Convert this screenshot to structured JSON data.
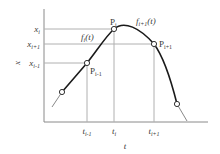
{
  "diagram": {
    "type": "piecewise-curve-interpolation",
    "colors": {
      "axis": "#8a8a8a",
      "grid": "#b0b0b0",
      "curve": "#1a1a1a",
      "tail": "#7a7a7a",
      "text": "#3a3a3a",
      "point_fill": "#ffffff",
      "point_stroke": "#333333"
    },
    "axes": {
      "y_label": "x",
      "x_label": "t"
    },
    "y_ticks": [
      {
        "base": "x",
        "sub": "i"
      },
      {
        "base": "x",
        "sub": "i+1"
      },
      {
        "base": "x",
        "sub": "i-1"
      }
    ],
    "x_ticks": [
      {
        "base": "t",
        "sub": "i-1"
      },
      {
        "base": "t",
        "sub": "i"
      },
      {
        "base": "t",
        "sub": "i+1"
      }
    ],
    "points": [
      {
        "base": "P",
        "sub": "i-1"
      },
      {
        "base": "P",
        "sub": "i"
      },
      {
        "base": "P",
        "sub": "i+1"
      }
    ],
    "curve_labels": [
      {
        "base": "f",
        "sub": "i",
        "arg": "(t)"
      },
      {
        "base": "f",
        "sub": "i+1",
        "arg": "(t)"
      }
    ]
  }
}
